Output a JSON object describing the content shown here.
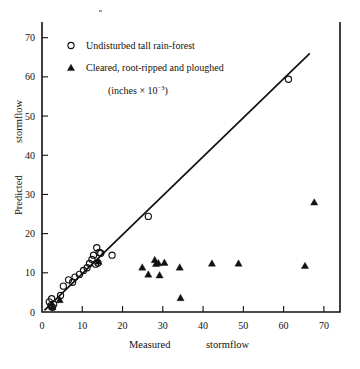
{
  "chart_data": {
    "type": "scatter",
    "title": "",
    "xlabel": "Measured        stormflow",
    "ylabel": "Predicted        stormflow",
    "xlabel_part1": "Measured",
    "xlabel_part2": "stormflow",
    "ylabel_part1": "Predicted",
    "ylabel_part2": "stormflow",
    "xlim": [
      0,
      74
    ],
    "ylim": [
      0,
      74
    ],
    "xticks": [
      0,
      10,
      20,
      30,
      40,
      50,
      60,
      70
    ],
    "yticks": [
      0,
      10,
      20,
      30,
      40,
      50,
      60,
      70
    ],
    "xtick_labels": [
      "0",
      "10",
      "20",
      "30",
      "40",
      "50",
      "60",
      "70"
    ],
    "ytick_labels": [
      "0",
      "10",
      "20",
      "30",
      "40",
      "50",
      "60",
      "70"
    ],
    "grid": false,
    "legend_position": "upper-left-inside",
    "units_note": "(inches × 10",
    "units_exponent": "−3",
    "units_note_close": ")",
    "series": [
      {
        "name": "Undisturbed tall rain-forest",
        "marker": "open-circle",
        "color": "#111111",
        "points": [
          [
            1.8,
            2.6
          ],
          [
            2.2,
            1.6
          ],
          [
            2.4,
            3.4
          ],
          [
            2.6,
            1.2
          ],
          [
            2.9,
            2.0
          ],
          [
            4.6,
            4.2
          ],
          [
            5.3,
            6.6
          ],
          [
            6.6,
            8.2
          ],
          [
            7.6,
            7.6
          ],
          [
            8.2,
            8.9
          ],
          [
            9.3,
            9.6
          ],
          [
            10.3,
            10.6
          ],
          [
            11.2,
            11.3
          ],
          [
            11.8,
            12.4
          ],
          [
            12.4,
            13.4
          ],
          [
            12.8,
            14.5
          ],
          [
            13.3,
            12.2
          ],
          [
            13.6,
            16.4
          ],
          [
            13.9,
            12.5
          ],
          [
            14.2,
            15.2
          ],
          [
            14.6,
            15.0
          ],
          [
            17.4,
            14.5
          ],
          [
            26.4,
            24.4
          ],
          [
            61.2,
            59.4
          ]
        ]
      },
      {
        "name": "Cleared, root-ripped and ploughed",
        "marker": "filled-triangle",
        "color": "#111111",
        "points": [
          [
            2.6,
            1.4
          ],
          [
            4.4,
            3.2
          ],
          [
            14.0,
            13.0
          ],
          [
            24.9,
            11.5
          ],
          [
            26.4,
            9.7
          ],
          [
            28.0,
            13.4
          ],
          [
            28.3,
            12.4
          ],
          [
            28.9,
            12.6
          ],
          [
            29.2,
            9.5
          ],
          [
            30.4,
            12.7
          ],
          [
            34.2,
            11.5
          ],
          [
            34.4,
            3.7
          ],
          [
            42.2,
            12.5
          ],
          [
            48.8,
            12.5
          ],
          [
            65.3,
            11.9
          ],
          [
            67.6,
            28.1
          ]
        ]
      }
    ],
    "reference_line": {
      "name": "1:1 regression line",
      "x_start": 0.6,
      "y_start": 0.4,
      "x_end": 66.5,
      "y_end": 66.0
    }
  },
  "legend": {
    "items": [
      {
        "marker": "open-circle",
        "label": "Undisturbed tall rain-forest"
      },
      {
        "marker": "filled-triangle",
        "label": "Cleared, root-ripped and ploughed"
      }
    ]
  }
}
